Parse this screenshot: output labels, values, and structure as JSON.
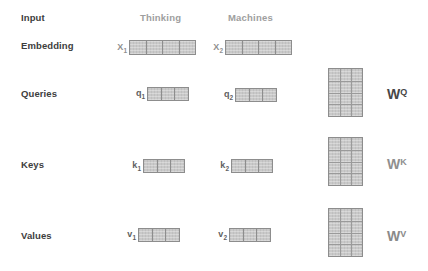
{
  "diagram": {
    "row_labels": [
      {
        "label": "Input"
      },
      {
        "label": "Embedding"
      },
      {
        "label": "Queries"
      },
      {
        "label": "Keys"
      },
      {
        "label": "Values"
      }
    ],
    "columns": [
      {
        "header": "Thinking"
      },
      {
        "header": "Machines"
      }
    ],
    "vectors": [
      {
        "base": "X",
        "sub": "1",
        "cells": 4
      },
      {
        "base": "X",
        "sub": "2",
        "cells": 4
      },
      {
        "base": "q",
        "sub": "1",
        "cells": 3
      },
      {
        "base": "q",
        "sub": "2",
        "cells": 3
      },
      {
        "base": "k",
        "sub": "1",
        "cells": 3
      },
      {
        "base": "k",
        "sub": "2",
        "cells": 3
      },
      {
        "base": "v",
        "sub": "1",
        "cells": 3
      },
      {
        "base": "v",
        "sub": "2",
        "cells": 3
      }
    ],
    "weight_matrices": [
      {
        "base": "W",
        "sup": "Q",
        "rows": 4,
        "cols": 3,
        "cell_count": 12,
        "label_color": "#474747"
      },
      {
        "base": "W",
        "sup": "K",
        "rows": 4,
        "cols": 3,
        "cell_count": 12,
        "label_color": "#8f8f8f"
      },
      {
        "base": "W",
        "sup": "V",
        "rows": 4,
        "cols": 3,
        "cell_count": 12,
        "label_color": "#8a8a8a"
      }
    ],
    "colors": {
      "background": "#ffffff",
      "row_label": "#3d3d3d",
      "column_header": "#9e9e9e",
      "cell_fill": "#c9c9c9",
      "cell_border": "#8d8d8d",
      "x_label": "#8f8f8f",
      "qkv_label": "#5f5f5f"
    }
  }
}
